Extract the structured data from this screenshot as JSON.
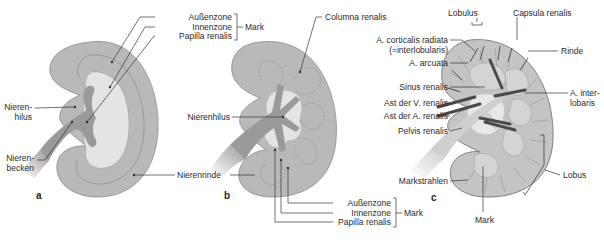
{
  "figure": {
    "panels": [
      {
        "id": "a",
        "letter": "a",
        "labels": {
          "aussenzone": "Außenzone",
          "innenzone": "Innenzone",
          "papilla": "Papilla renalis",
          "mark": "Mark",
          "hilus": "Nieren-\nhilus",
          "hilus_l1": "Nieren-",
          "hilus_l2": "hilus",
          "becken_l1": "Nieren-",
          "becken_l2": "becken",
          "rinde": "Nierenrinde"
        }
      },
      {
        "id": "b",
        "letter": "b",
        "labels": {
          "columna": "Columna renalis",
          "hilus": "Nierenhilus",
          "aussenzone": "Außenzone",
          "innenzone": "Innenzone",
          "papilla": "Papilla renalis",
          "mark": "Mark"
        }
      },
      {
        "id": "c",
        "letter": "c",
        "labels": {
          "lobulus": "Lobulus",
          "capsula": "Capsula renalis",
          "corticalis_l1": "A. corticalis radiata",
          "corticalis_l2": "(=interlobularis)",
          "arcuata": "A. arcuata",
          "rinde": "Rinde",
          "sinus": "Sinus renalis",
          "interlobaris_l1": "A. inter-",
          "interlobaris_l2": "lobaris",
          "ast_v": "Ast der V. renalis",
          "ast_a": "Ast der A. renalis",
          "pelvis": "Pelvis renalis",
          "lobus": "Lobus",
          "markstrahlen": "Markstrahlen",
          "mark": "Mark"
        }
      }
    ],
    "colors": {
      "cortex": "#b9b9b9",
      "outer_medulla": "#c8c8c8",
      "inner_medulla": "#e4e4e4",
      "pelvis": "#9a9a9a",
      "line": "#333333",
      "vessel": "#555555"
    }
  }
}
